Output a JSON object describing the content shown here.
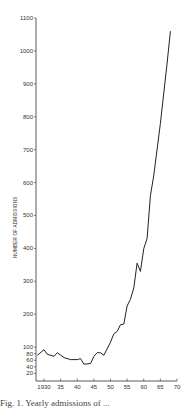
{
  "chart_data": {
    "type": "line",
    "title": "",
    "xlabel": "",
    "ylabel": "NUMBER OF ADMISSIONS",
    "xlim": [
      1928,
      1970
    ],
    "ylim": [
      0,
      1100
    ],
    "grid": false,
    "legend": null,
    "x_ticks": [
      "1930",
      "35",
      "40",
      "45",
      "50",
      "55",
      "60",
      "65",
      "70"
    ],
    "x_tick_values": [
      1930,
      1935,
      1940,
      1945,
      1950,
      1955,
      1960,
      1965,
      1970
    ],
    "y_ticks": [
      20,
      40,
      60,
      80,
      100,
      200,
      300,
      400,
      500,
      600,
      700,
      800,
      900,
      1000,
      1100
    ],
    "series": [
      {
        "name": "Admissions",
        "x": [
          1928,
          1930,
          1931,
          1933,
          1934,
          1936,
          1938,
          1940,
          1941,
          1942,
          1944,
          1945,
          1946,
          1947,
          1948,
          1950,
          1951,
          1952,
          1953,
          1954,
          1955,
          1956,
          1957,
          1958,
          1959,
          1960,
          1961,
          1962,
          1963,
          1965,
          1967,
          1968
        ],
        "values": [
          75,
          92,
          78,
          72,
          83,
          68,
          62,
          62,
          65,
          48,
          50,
          72,
          83,
          83,
          75,
          115,
          140,
          148,
          168,
          170,
          225,
          245,
          280,
          355,
          330,
          400,
          430,
          560,
          620,
          780,
          960,
          1060
        ]
      }
    ],
    "caption": "Fig. 1.  Yearly admissions of ..."
  },
  "caption": "Fig. 1.  Yearly admissions of ..."
}
